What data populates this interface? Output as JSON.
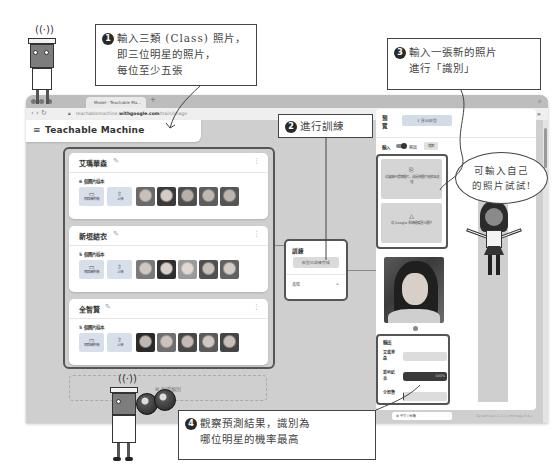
{
  "browser": {
    "tab_title": "Model - Teachable Ma...",
    "new_tab": "+",
    "url_prefix": "teachablemachine.",
    "url_domain": "withgoogle.com",
    "url_path": "/train/image",
    "toolbar_icons": "☷ ▦ ▷ ♡ ⋮ ≡"
  },
  "app": {
    "title": "Teachable Machine",
    "menu_icon": "≡"
  },
  "classes": [
    {
      "name": "艾瑪華森",
      "sample_count": "6 個圖片樣本",
      "webcam_label": "網路攝影機",
      "upload_label": "上傳",
      "thumb_colors": [
        "#6a6a6a",
        "#7c7c7c",
        "#4f4f4f",
        "#5d5d5d",
        "#555555"
      ]
    },
    {
      "name": "新垣結衣",
      "sample_count": "5 個圖片樣本",
      "webcam_label": "網路攝影機",
      "upload_label": "上傳",
      "thumb_colors": [
        "#7a7a7a",
        "#3e3e3e",
        "#9a9a9a",
        "#505050",
        "#616161"
      ]
    },
    {
      "name": "全智賢",
      "sample_count": "5 個圖片樣本",
      "webcam_label": "網路攝影機",
      "upload_label": "上傳",
      "thumb_colors": [
        "#3a3a3a",
        "#6f6f6f",
        "#484848",
        "#5a5a5a",
        "#444444"
      ]
    }
  ],
  "add_class": "⊞ 新增類別",
  "training": {
    "title": "訓練",
    "button": "模型已訓練完成",
    "advanced": "進階",
    "chevron": "⌄"
  },
  "preview": {
    "title": "預覽",
    "export_button": "⇪  匯出模型",
    "input_label": "輸入",
    "toggle_state": "開啟",
    "source_select": "檔案",
    "drop_text": "從電腦中選擇圖片，或是將圖片拖放至這裡",
    "drive_text": "從 Google 雲端硬碟匯入圖片",
    "output_title": "輸出",
    "outputs": [
      {
        "label": "艾瑪華森",
        "percent": 0,
        "display": ""
      },
      {
        "label": "新垣結衣",
        "percent": 100,
        "display": "100%"
      },
      {
        "label": "全智賢",
        "percent": 3,
        "display": ""
      }
    ]
  },
  "footer": {
    "language": "⊕ 中文 (台灣)",
    "version": "TensorFlow.js 1.3.1 | tmimage 0.8.x"
  },
  "callouts": {
    "c1_num": "1",
    "c1_line1": "輸入三類 (Class) 照片，",
    "c1_line2": "即三位明星的照片，",
    "c1_line3": "每位至少五張",
    "c2_num": "2",
    "c2_line1": "進行訓練",
    "c3_num": "3",
    "c3_line1": "輸入一張新的照片",
    "c3_line2": "進行「識別」",
    "c4_num": "4",
    "c4_line1": "觀察預測結果，識別為",
    "c4_line2": "哪位明星的機率最高",
    "bubble_line1": "可輸入自己",
    "bubble_line2": "的照片試試!"
  }
}
